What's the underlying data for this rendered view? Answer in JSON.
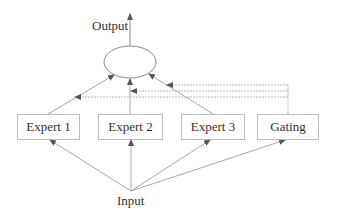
{
  "diagram": {
    "output_label": "Output",
    "input_label": "Input",
    "combiner": {
      "shape": "ellipse"
    },
    "nodes": [
      {
        "id": "expert1",
        "label": "Expert 1"
      },
      {
        "id": "expert2",
        "label": "Expert 2"
      },
      {
        "id": "expert3",
        "label": "Expert 3"
      },
      {
        "id": "gating",
        "label": "Gating"
      }
    ],
    "edges": [
      {
        "from": "input",
        "to": "expert1"
      },
      {
        "from": "input",
        "to": "expert2"
      },
      {
        "from": "input",
        "to": "expert3"
      },
      {
        "from": "input",
        "to": "gating"
      },
      {
        "from": "expert1",
        "to": "combiner"
      },
      {
        "from": "expert2",
        "to": "combiner"
      },
      {
        "from": "expert3",
        "to": "combiner"
      },
      {
        "from": "gating",
        "to": "expert1-output-line",
        "style": "dashed"
      },
      {
        "from": "gating",
        "to": "expert2-output-line",
        "style": "dashed"
      },
      {
        "from": "gating",
        "to": "expert3-output-line",
        "style": "dashed"
      },
      {
        "from": "combiner",
        "to": "output"
      }
    ],
    "colors": {
      "line": "#a8a8a8",
      "text": "#333333",
      "box_border": "#bdbdbd"
    }
  }
}
